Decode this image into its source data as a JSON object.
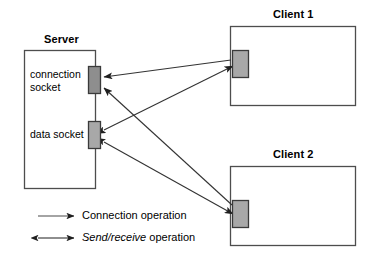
{
  "diagram": {
    "title_server": "Server",
    "title_client1": "Client 1",
    "title_client2": "Client 2",
    "label_connection_socket_line1": "connection",
    "label_connection_socket_line2": "socket",
    "label_data_socket": "data socket",
    "colors": {
      "socket_fill": "#a8a8a8",
      "socket_fill_dark": "#8e8e8e",
      "box_stroke": "#4d4d4d",
      "socket_stroke": "#3a3a3a",
      "arrow_stroke": "#333333",
      "background": "#ffffff"
    }
  },
  "legend": {
    "items": [
      {
        "id": "connection-operation",
        "arrow": "single",
        "label": "Connection operation",
        "italic_part": "",
        "rest": "Connection operation"
      },
      {
        "id": "send-receive-operation",
        "arrow": "double",
        "label": "Send/receive operation",
        "italic_part": "Send/receive",
        "rest": " operation"
      }
    ]
  },
  "arrows": [
    {
      "id": "client1-connect-to-connection-socket",
      "type": "single",
      "from": "client1-socket",
      "to": "server-connection-socket"
    },
    {
      "id": "client2-connect-to-connection-socket",
      "type": "single",
      "from": "client2-socket",
      "to": "server-connection-socket"
    },
    {
      "id": "client1-data-exchange",
      "type": "double",
      "from": "server-data-socket",
      "to": "client1-socket"
    },
    {
      "id": "client2-data-exchange",
      "type": "double",
      "from": "server-data-socket",
      "to": "client2-socket"
    }
  ]
}
